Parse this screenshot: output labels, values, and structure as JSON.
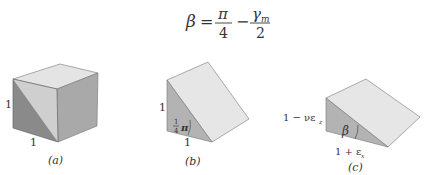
{
  "equation": {
    "lhs": "β",
    "eq": "=",
    "frac1_num": "π",
    "frac1_den": "4",
    "minus": "−",
    "frac2_num": "γ",
    "frac2_num_sub": "m",
    "frac2_den": "2"
  },
  "figures": [
    {
      "id": "a",
      "caption": "(a)",
      "side_label": "1",
      "bottom_label": "1"
    },
    {
      "id": "b",
      "caption": "(b)",
      "side_label": "1",
      "bottom_label": "1",
      "angle_num": "1",
      "angle_den": "4",
      "angle_sym": "π"
    },
    {
      "id": "c",
      "caption": "(c)",
      "side_label": "1 − νε",
      "side_label_sub": "z",
      "bottom_label": "1 + ε",
      "bottom_label_sub": "x",
      "angle_label": "β"
    }
  ],
  "colors": {
    "top_face": "#e4e4e4",
    "front_light": "#cfcfcf",
    "front_dark": "#8a8a8a",
    "right_face": "#a9a9a9",
    "wedge_side": "#b3b3b3",
    "wedge_slope": "#e6e6e6",
    "edge": "#6a6a6a"
  }
}
